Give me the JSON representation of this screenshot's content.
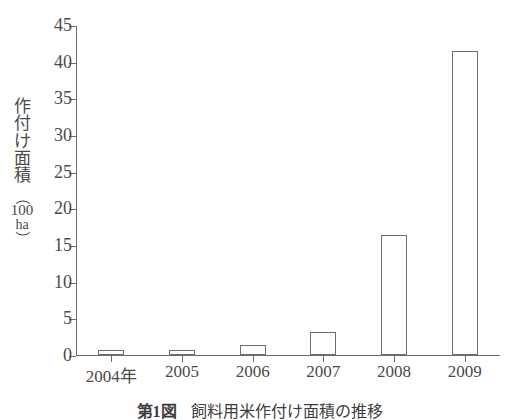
{
  "chart_data": {
    "type": "bar",
    "title": "飼料用米作付け面積の推移",
    "figure_number": "第1図",
    "categories": [
      "2004年",
      "2005",
      "2006",
      "2007",
      "2008",
      "2009"
    ],
    "values": [
      0.7,
      0.7,
      1.4,
      3.1,
      16.4,
      41.4
    ],
    "xlabel": "",
    "ylabel": "作付け面積（100 ha）",
    "ylabel_chars": [
      "作",
      "付",
      "け",
      "面",
      "積"
    ],
    "ylabel_unit_open": "（",
    "ylabel_unit_value": "100",
    "ylabel_unit_suffix": "ha",
    "ylabel_unit_close": "）",
    "ylim": [
      0,
      45
    ],
    "yticks": [
      0,
      5,
      10,
      15,
      20,
      25,
      30,
      35,
      40,
      45
    ],
    "ytick_labels": [
      "0",
      "5",
      "10",
      "15",
      "20",
      "25",
      "30",
      "35",
      "40",
      "45"
    ],
    "grid": false,
    "legend": null,
    "bar_style": "outline",
    "bar_fill_color": "#ffffff",
    "bar_edge_color": "#6f6f6f",
    "axis_color": "#6a6a6a",
    "text_color": "#4a4a4a",
    "background_color": "#ffffff"
  },
  "caption": {
    "number": "第1図",
    "text": "飼料用米作付け面積の推移"
  }
}
